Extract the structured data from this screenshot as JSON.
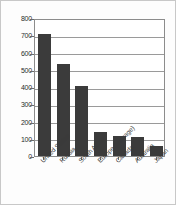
{
  "chart_data": {
    "type": "bar",
    "title": "",
    "subtitle": "",
    "xlabel": "",
    "ylabel": "",
    "categories": [
      "United States",
      "Russia",
      "South Africa",
      "Europe (average)",
      "Canada",
      "Australia",
      "Japan"
    ],
    "values": [
      705,
      535,
      408,
      140,
      115,
      110,
      60
    ],
    "ylim": [
      0,
      800
    ],
    "ytick_labels": [
      "0",
      "100",
      "200",
      "300",
      "400",
      "500",
      "600",
      "700",
      "800"
    ],
    "ytick_values": [
      0,
      100,
      200,
      300,
      400,
      500,
      600,
      700,
      800
    ],
    "grid": true,
    "grid_axis": "y",
    "legend": false,
    "legend_position": "none",
    "bar_color": "#3b3b3b",
    "axis_color": "#8c8c8c",
    "grid_color": "#9a9a9a",
    "plot_background": "#ffffff",
    "figure_background": "#fdfdfd",
    "frame_border_color": "#c8c8c8",
    "annotations": []
  }
}
